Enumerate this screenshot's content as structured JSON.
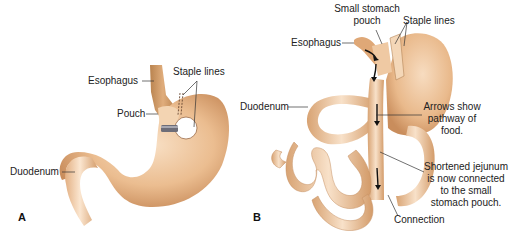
{
  "figure": {
    "panels": [
      {
        "id": "A",
        "letter": "A",
        "labels": {
          "esophagus": "Esophagus",
          "staple_lines": "Staple lines",
          "pouch": "Pouch",
          "duodenum": "Duodenum"
        }
      },
      {
        "id": "B",
        "letter": "B",
        "labels": {
          "small_stomach_pouch_1": "Small stomach",
          "small_stomach_pouch_2": "pouch",
          "staple_lines": "Staple lines",
          "esophagus": "Esophagus",
          "duodenum": "Duodenum",
          "arrows_1": "Arrows show",
          "arrows_2": "pathway of",
          "arrows_3": "food.",
          "jejunum_1": "Shortened jejunum",
          "jejunum_2": "is now connected",
          "jejunum_3": "to the small",
          "jejunum_4": "stomach pouch.",
          "connection": "Connection"
        }
      }
    ],
    "colors": {
      "tissue": "#e8b98a",
      "tissue_light": "#f6dcc0",
      "tissue_dark": "#c98d5c",
      "band": "#6d6d78",
      "label_text": "#222222",
      "leader_line": "#333333"
    }
  }
}
